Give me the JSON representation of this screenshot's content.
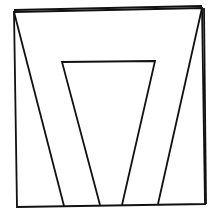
{
  "diagram": {
    "background": "#ffffff",
    "stroke_color": "#111111",
    "outer_frame": {
      "top_left": [
        14,
        12
      ],
      "top_right": [
        202,
        8
      ],
      "bottom_right": [
        205,
        204
      ],
      "bottom_left": [
        17,
        207
      ]
    },
    "outer_frame_top_double": {
      "top_left": [
        14,
        10
      ],
      "top_right": [
        202,
        6
      ]
    },
    "right_edge_double": {
      "top": [
        204,
        8
      ],
      "bottom": [
        206,
        204
      ]
    },
    "inner_trapezoid": {
      "top_left": [
        62,
        62
      ],
      "top_right": [
        155,
        61
      ],
      "bottom_left": [
        100,
        205
      ],
      "bottom_right": [
        122,
        205
      ]
    },
    "left_diagonal": {
      "from": [
        14,
        12
      ],
      "to": [
        64,
        206
      ]
    },
    "right_diagonal": {
      "from": [
        202,
        8
      ],
      "to": [
        158,
        204
      ]
    }
  }
}
